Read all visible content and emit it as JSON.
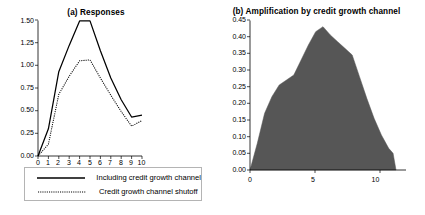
{
  "figure": {
    "panel_a": {
      "title": "(a) Responses",
      "yticks": [
        "0.00",
        "0.25",
        "0.50",
        "0.75",
        "1.00",
        "1.25",
        "1.50"
      ],
      "xticks": [
        "0",
        "1",
        "2",
        "3",
        "4",
        "5",
        "6",
        "7",
        "8",
        "9",
        "10"
      ],
      "legend": [
        {
          "label": "Including credit growth channel",
          "style": "solid"
        },
        {
          "label": "Credit growth channel shutoff",
          "style": "dotted"
        }
      ]
    },
    "panel_b": {
      "title": "(b) Amplification by credit growth channel",
      "yticks": [
        "0.00",
        "0.05",
        "0.10",
        "0.15",
        "0.20",
        "0.25",
        "0.30",
        "0.35",
        "0.40",
        "0.45"
      ],
      "xticks": [
        "0",
        "5",
        "10"
      ]
    }
  },
  "chart_data": [
    {
      "type": "line",
      "title": "(a) Responses",
      "xlabel": "",
      "ylabel": "",
      "xlim": [
        0,
        10
      ],
      "ylim": [
        0.0,
        1.5
      ],
      "grid": false,
      "legend_position": "below-plot",
      "x": [
        0,
        1,
        2,
        3,
        4,
        5,
        6,
        7,
        8,
        9,
        10
      ],
      "series": [
        {
          "name": "Including credit growth channel",
          "style": "solid",
          "color": "#000000",
          "values": [
            0.0,
            0.3,
            0.93,
            1.22,
            1.49,
            1.49,
            1.16,
            0.86,
            0.62,
            0.43,
            0.45
          ]
        },
        {
          "name": "Credit growth channel shutoff",
          "style": "dotted",
          "color": "#000000",
          "values": [
            0.0,
            0.13,
            0.68,
            0.88,
            1.05,
            1.06,
            0.86,
            0.67,
            0.49,
            0.33,
            0.39
          ]
        }
      ]
    },
    {
      "type": "area",
      "title": "(b) Amplification by credit growth channel",
      "xlabel": "",
      "ylabel": "",
      "xlim": [
        0,
        10
      ],
      "ylim": [
        0.0,
        0.45
      ],
      "grid": false,
      "fill_color": "#565656",
      "x": [
        0.0,
        0.5,
        1.0,
        1.5,
        2.0,
        2.5,
        3.0,
        3.5,
        4.0,
        4.5,
        5.0,
        5.5,
        6.0,
        6.5,
        7.0,
        7.5,
        8.0,
        8.5,
        9.0,
        9.5,
        9.8,
        10.0
      ],
      "values": [
        0.0,
        0.08,
        0.17,
        0.22,
        0.255,
        0.27,
        0.285,
        0.33,
        0.375,
        0.415,
        0.43,
        0.405,
        0.385,
        0.365,
        0.345,
        0.28,
        0.215,
        0.155,
        0.105,
        0.065,
        0.05,
        0.0
      ]
    }
  ]
}
